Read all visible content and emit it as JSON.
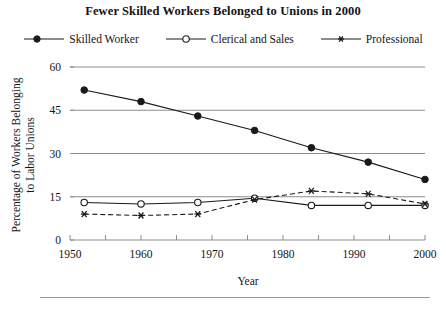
{
  "chart_data": {
    "type": "line",
    "title": "Fewer Skilled Workers Belonged to Unions in 2000",
    "xlabel": "Year",
    "ylabel": "Percentage of Workers Belonging to Labor Unions",
    "ylabel_line1": "Percentage of Workers Belonging",
    "ylabel_line2": "to Labor Unions",
    "x": [
      1952,
      1960,
      1968,
      1976,
      1984,
      1992,
      2000
    ],
    "xlim": [
      1950,
      2000
    ],
    "ylim": [
      0,
      60
    ],
    "xticks": [
      1950,
      1960,
      1970,
      1980,
      1990,
      2000
    ],
    "xtick_labels": [
      "1950",
      "1960",
      "1970",
      "1980",
      "1990",
      "2000"
    ],
    "xminor_step": 5,
    "yticks": [
      0,
      15,
      30,
      45,
      60
    ],
    "ytick_labels": [
      "0",
      "15",
      "30",
      "45",
      "60"
    ],
    "grid": "horizontal",
    "legend_position": "top-center",
    "series": [
      {
        "name": "Skilled Worker",
        "marker": "filled-circle",
        "linestyle": "solid",
        "color": "#1a1a1a",
        "values": [
          52,
          48,
          43,
          38,
          32,
          27,
          21
        ]
      },
      {
        "name": "Clerical and Sales",
        "marker": "open-circle",
        "linestyle": "solid",
        "color": "#1a1a1a",
        "values": [
          13,
          12.5,
          13,
          14.5,
          12,
          12,
          12
        ]
      },
      {
        "name": "Professional",
        "marker": "asterisk",
        "linestyle": "dashed",
        "color": "#1a1a1a",
        "values": [
          9,
          8.5,
          9,
          14,
          17,
          16,
          12.5
        ]
      }
    ]
  },
  "legend": {
    "items": [
      {
        "label": "Skilled Worker"
      },
      {
        "label": "Clerical and Sales"
      },
      {
        "label": "Professional"
      }
    ]
  }
}
